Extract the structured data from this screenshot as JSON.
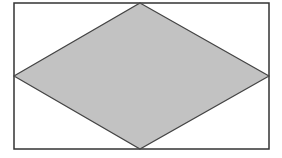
{
  "diagram": {
    "type": "rhombus-inscribed-in-rectangle",
    "rectangle": {
      "x": 14,
      "y": 3,
      "width": 255,
      "height": 146,
      "stroke": "#333333",
      "fill": "#ffffff"
    },
    "rhombus": {
      "points": [
        [
          140,
          3
        ],
        [
          269,
          76
        ],
        [
          140,
          149
        ],
        [
          14,
          76
        ]
      ],
      "fill": "#c2c2c2",
      "stroke": "#444444"
    },
    "labels": []
  }
}
